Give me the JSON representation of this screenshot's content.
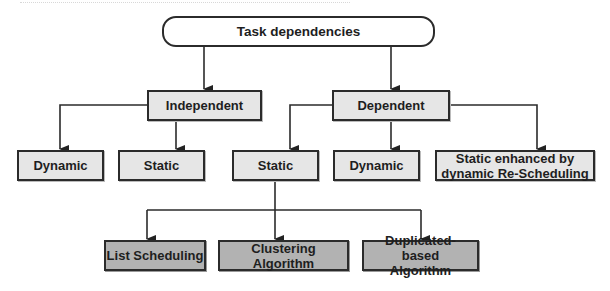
{
  "diagram": {
    "type": "hierarchy-tree",
    "colors": {
      "stroke": "#2b2b2b",
      "level_fill": "#e6e6e6",
      "leaf_fill": "#b2b2b2",
      "root_fill": "#ffffff"
    },
    "root": {
      "label": "Task dependencies"
    },
    "level1": [
      {
        "label": "Independent"
      },
      {
        "label": "Dependent"
      }
    ],
    "level2": [
      {
        "label": "Dynamic",
        "parent": "Independent"
      },
      {
        "label": "Static",
        "parent": "Independent"
      },
      {
        "label": "Static",
        "parent": "Dependent"
      },
      {
        "label": "Dynamic",
        "parent": "Dependent"
      },
      {
        "label": "Static enhanced by dynamic Re-Scheduling",
        "parent": "Dependent"
      }
    ],
    "level3": [
      {
        "label": "List Scheduling",
        "parent": "Static (Dependent)"
      },
      {
        "label": "Clustering Algorithm",
        "parent": "Static (Dependent)"
      },
      {
        "label": "Duplicated-based Algorithm",
        "parent": "Static (Dependent)"
      }
    ]
  }
}
